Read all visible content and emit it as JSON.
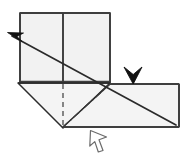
{
  "figure": {
    "type": "line-diagram",
    "width": 190,
    "height": 154,
    "background_color": "#ffffff"
  },
  "style": {
    "paper_fill": "#f2f2f2",
    "paper_fill_light": "#f6f6f6",
    "edge_color": "#2b2b2b",
    "edge_color_soft": "#555555",
    "crease_dashed_color": "#4a4a4a",
    "crease_dashdot_color": "#3a3a3a",
    "arrow_solid_color": "#111111",
    "arrow_hollow_fill": "#ffffff",
    "arrow_hollow_stroke": "#6b6b6b",
    "edge_width": 1.6,
    "thin_width": 1.1
  },
  "shapes": {
    "top_square": {
      "name": "upper-square-panel",
      "points": "20,13 110,13 110,82 20,82",
      "divider_x": 63,
      "divider_top_y": 13,
      "divider_bottom_y": 82
    },
    "lower_left_flap": {
      "name": "lower-left-triangular-flap",
      "points": "18,83 110,83 63,128"
    },
    "lower_right_flap": {
      "name": "lower-right-parallelogram-flap",
      "points": "110,84 179,84 179,127 63,127"
    }
  },
  "creases": [
    {
      "name": "vertical-center-crease",
      "style": "solid",
      "points": "63,13 63,82"
    },
    {
      "name": "hidden-vertical-crease",
      "style": "dashed",
      "points": "63,84 63,127"
    },
    {
      "name": "mountain-valley-dashdot-crease",
      "style": "dash-dot",
      "points": "63,127 110,84"
    },
    {
      "name": "long-diagonal-fold-line",
      "style": "solid",
      "points": "176,125 12,36"
    },
    {
      "name": "lower-horizontal-edge",
      "style": "solid",
      "points": "18,83 110,83"
    }
  ],
  "arrows": [
    {
      "name": "fold-direction-arrow-upper-left",
      "kind": "solid-arrowhead",
      "direction": "up-left",
      "tip": "8,33",
      "label": ""
    },
    {
      "name": "push-down-arrow-top-right",
      "kind": "solid-chevron",
      "direction": "down",
      "tip": "133,84",
      "label": ""
    },
    {
      "name": "pointer-arrow-bottom",
      "kind": "hollow-arrowhead",
      "direction": "up-left",
      "tip": "91,131",
      "label": ""
    }
  ],
  "annotations": {
    "caption": "",
    "step_number": ""
  }
}
